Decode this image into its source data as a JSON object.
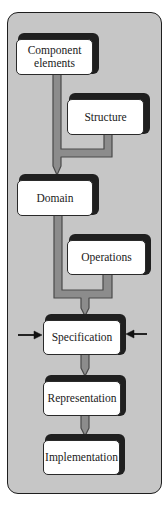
{
  "diagram": {
    "type": "flow",
    "orientation": "top-to-bottom",
    "nodes": [
      {
        "id": "component",
        "label": "Component elements"
      },
      {
        "id": "structure",
        "label": "Structure"
      },
      {
        "id": "domain",
        "label": "Domain"
      },
      {
        "id": "operations",
        "label": "Operations"
      },
      {
        "id": "specification",
        "label": "Specification"
      },
      {
        "id": "representation",
        "label": "Representation"
      },
      {
        "id": "implementation",
        "label": "Implementation"
      }
    ],
    "edges": [
      {
        "from": "component",
        "to": "domain"
      },
      {
        "from": "structure",
        "to": "domain"
      },
      {
        "from": "domain",
        "to": "specification"
      },
      {
        "from": "operations",
        "to": "specification"
      },
      {
        "from": "specification",
        "to": "representation"
      },
      {
        "from": "representation",
        "to": "implementation"
      }
    ],
    "side_arrows": [
      {
        "target": "specification",
        "direction": "from-left"
      },
      {
        "target": "specification",
        "direction": "from-right"
      }
    ],
    "colors": {
      "panel": "#c6c6c6",
      "pipe": "#8c8c8c",
      "pipe_outline": "#4a4a4a",
      "box_face": "#ffffff",
      "box_shadow": "#1f1f1f",
      "arrow": "#111111"
    }
  }
}
